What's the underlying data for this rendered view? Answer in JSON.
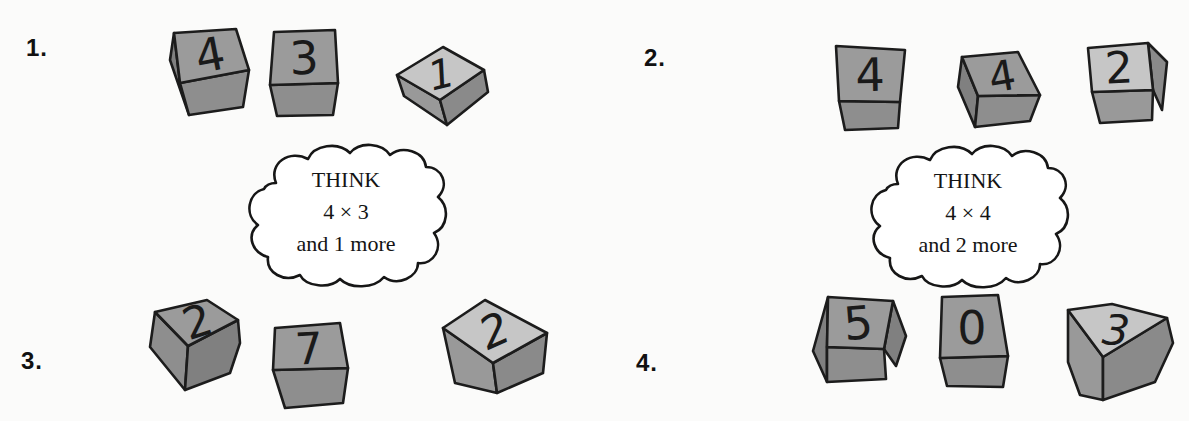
{
  "colors": {
    "background": "#fbfbfa",
    "outline": "#1c1c1c",
    "digit_ink": "#1a1a1a",
    "label_ink": "#111111",
    "cloud_fill": "#ffffff",
    "cloud_text": "#141414",
    "block_dark_top": "#9b9b9b",
    "block_dark_front": "#8e8e8e",
    "block_dark_side": "#808080",
    "block_light_top": "#c6c6c6",
    "block_light_front": "#999999",
    "block_light_side": "#8a8a8a"
  },
  "problems": [
    {
      "number": "1.",
      "blocks": [
        {
          "value": "4",
          "shade": "dark"
        },
        {
          "value": "3",
          "shade": "dark"
        },
        {
          "value": "1",
          "shade": "light"
        }
      ],
      "think": {
        "line1": "THINK",
        "line2": "4 × 3",
        "line3": "and 1 more"
      }
    },
    {
      "number": "2.",
      "blocks": [
        {
          "value": "4",
          "shade": "dark"
        },
        {
          "value": "4",
          "shade": "dark"
        },
        {
          "value": "2",
          "shade": "light"
        }
      ],
      "think": {
        "line1": "THINK",
        "line2": "4 × 4",
        "line3": "and 2 more"
      }
    },
    {
      "number": "3.",
      "blocks": [
        {
          "value": "2",
          "shade": "dark"
        },
        {
          "value": "7",
          "shade": "dark"
        },
        {
          "value": "2",
          "shade": "light"
        }
      ]
    },
    {
      "number": "4.",
      "blocks": [
        {
          "value": "5",
          "shade": "dark"
        },
        {
          "value": "0",
          "shade": "dark"
        },
        {
          "value": "3",
          "shade": "light"
        }
      ]
    }
  ]
}
